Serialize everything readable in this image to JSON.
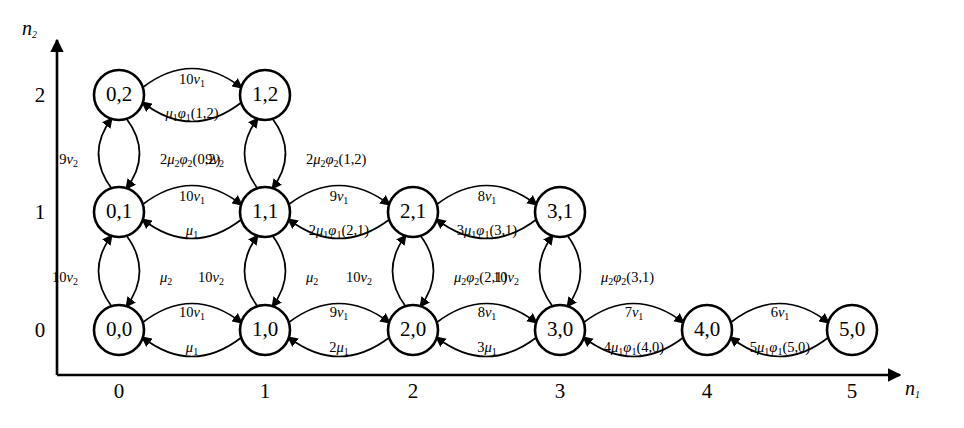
{
  "figure": {
    "type": "state-transition-diagram",
    "axes": {
      "x": {
        "name": "n",
        "subscript": "1",
        "ticks": [
          "0",
          "1",
          "2",
          "3",
          "4",
          "5"
        ]
      },
      "y": {
        "name": "n",
        "subscript": "2",
        "ticks": [
          "0",
          "1",
          "2"
        ]
      }
    },
    "nodes": [
      {
        "id": "0,0",
        "label": "0,0",
        "n1": 0,
        "n2": 0
      },
      {
        "id": "1,0",
        "label": "1,0",
        "n1": 1,
        "n2": 0
      },
      {
        "id": "2,0",
        "label": "2,0",
        "n1": 2,
        "n2": 0
      },
      {
        "id": "3,0",
        "label": "3,0",
        "n1": 3,
        "n2": 0
      },
      {
        "id": "4,0",
        "label": "4,0",
        "n1": 4,
        "n2": 0
      },
      {
        "id": "5,0",
        "label": "5,0",
        "n1": 5,
        "n2": 0
      },
      {
        "id": "0,1",
        "label": "0,1",
        "n1": 0,
        "n2": 1
      },
      {
        "id": "1,1",
        "label": "1,1",
        "n1": 1,
        "n2": 1
      },
      {
        "id": "2,1",
        "label": "2,1",
        "n1": 2,
        "n2": 1
      },
      {
        "id": "3,1",
        "label": "3,1",
        "n1": 3,
        "n2": 1
      },
      {
        "id": "0,2",
        "label": "0,2",
        "n1": 0,
        "n2": 2
      },
      {
        "id": "1,2",
        "label": "1,2",
        "n1": 1,
        "n2": 2
      }
    ],
    "edge_labels": {
      "row0_fwd_0_1": "10v₁",
      "row0_bwd_1_0": "μ₁",
      "row0_fwd_1_2": "9v₁",
      "row0_bwd_2_1": "2μ₁",
      "row0_fwd_2_3": "8v₁",
      "row0_bwd_3_2": "3μ₁",
      "row0_fwd_3_4": "7v₁",
      "row0_bwd_4_3": "4μ₁φ₁(4,0)",
      "row0_fwd_4_5": "6v₁",
      "row0_bwd_5_4": "5μ₁φ₁(5,0)",
      "row1_fwd_0_1": "10v₁",
      "row1_bwd_1_0": "μ₁",
      "row1_fwd_1_2": "9v₁",
      "row1_bwd_2_1": "2μ₁φ₁(2,1)",
      "row1_fwd_2_3": "8v₁",
      "row1_bwd_3_2": "3μ₁φ₁(3,1)",
      "row2_fwd_0_1": "10v₁",
      "row2_bwd_1_0": "μ₁φ₁(1,2)",
      "col0_up_0_1": "10v₂",
      "col0_dn_1_0": "μ₂",
      "col0_up_1_2": "9v₂",
      "col0_dn_2_1": "2μ₂φ₂(0,2)",
      "col1_up_0_1": "10v₂",
      "col1_dn_1_0": "μ₂",
      "col1_up_1_2": "9v₂",
      "col1_dn_2_1": "2μ₂φ₂(1,2)",
      "col2_up_0_1": "10v₂",
      "col2_dn_1_0": "μ₂φ₂(2,1)",
      "col3_up_0_1": "10v₂",
      "col3_dn_1_0": "μ₂φ₂(3,1)"
    }
  }
}
